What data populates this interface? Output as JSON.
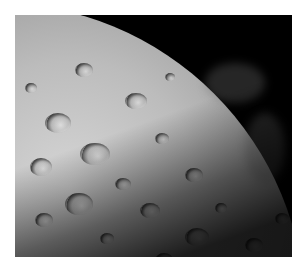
{
  "image": {
    "subject": "Lunar surface with craters, curved limb against black space",
    "alt": "Black-and-white photograph of the cratered surface of the Moon",
    "colors": {
      "background": "#ffffff",
      "space": "#000000",
      "surface_light": "#d6d6d6",
      "surface_mid": "#9a9a9a",
      "shadow": "#0c0c0c"
    }
  }
}
